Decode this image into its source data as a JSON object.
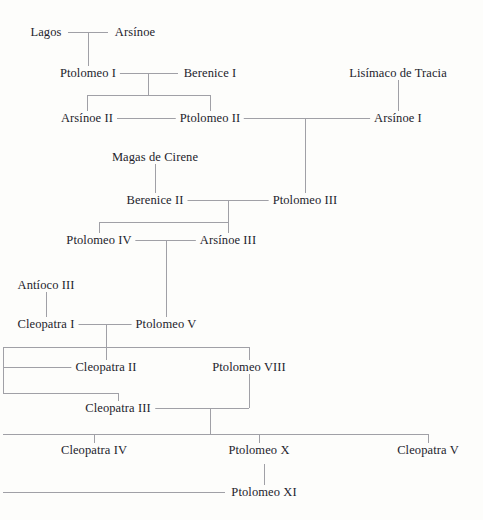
{
  "diagram": {
    "line_color": "#a0a0a6",
    "text_color": "#23232b",
    "background_color": "#fdfdfb"
  },
  "nodes": [
    {
      "id": "lagos",
      "label": "Lagos",
      "x": 46,
      "y": 32
    },
    {
      "id": "arsinoe",
      "label": "Arsínoe",
      "x": 135,
      "y": 32
    },
    {
      "id": "ptolomeo1",
      "label": "Ptolomeo I",
      "x": 88,
      "y": 73
    },
    {
      "id": "berenice1",
      "label": "Berenice I",
      "x": 210,
      "y": 73
    },
    {
      "id": "lisimaco",
      "label": "Lisímaco de Tracia",
      "x": 398,
      "y": 73
    },
    {
      "id": "arsinoe2",
      "label": "Arsínoe II",
      "x": 87,
      "y": 118
    },
    {
      "id": "ptolomeo2",
      "label": "Ptolomeo II",
      "x": 210,
      "y": 118
    },
    {
      "id": "arsinoe1",
      "label": "Arsínoe I",
      "x": 398,
      "y": 118
    },
    {
      "id": "magas",
      "label": "Magas de Cirene",
      "x": 155,
      "y": 157
    },
    {
      "id": "berenice2",
      "label": "Berenice II",
      "x": 155,
      "y": 200
    },
    {
      "id": "ptolomeo3",
      "label": "Ptolomeo III",
      "x": 305,
      "y": 200
    },
    {
      "id": "ptolomeo4",
      "label": "Ptolomeo IV",
      "x": 99,
      "y": 240
    },
    {
      "id": "arsinoe3",
      "label": "Arsínoe III",
      "x": 228,
      "y": 240
    },
    {
      "id": "antioco3",
      "label": "Antíoco III",
      "x": 46,
      "y": 285
    },
    {
      "id": "cleopatra1",
      "label": "Cleopatra I",
      "x": 46,
      "y": 324
    },
    {
      "id": "ptolomeo5",
      "label": "Ptolomeo V",
      "x": 166,
      "y": 324
    },
    {
      "id": "cleopatra2",
      "label": "Cleopatra II",
      "x": 106,
      "y": 367
    },
    {
      "id": "ptolomeo8",
      "label": "Ptolomeo VIII",
      "x": 249,
      "y": 367
    },
    {
      "id": "cleopatra3",
      "label": "Cleopatra III",
      "x": 118,
      "y": 408
    },
    {
      "id": "cleopatra4",
      "label": "Cleopatra IV",
      "x": 94,
      "y": 450
    },
    {
      "id": "ptolomeo10",
      "label": "Ptolomeo X",
      "x": 259,
      "y": 450
    },
    {
      "id": "cleopatra5",
      "label": "Cleopatra V",
      "x": 428,
      "y": 450
    },
    {
      "id": "ptolomeo11",
      "label": "Ptolomeo XI",
      "x": 264,
      "y": 492
    }
  ],
  "hlines": [
    {
      "id": "lagos-arsinoe-union",
      "x": 68,
      "y": 32,
      "w": 40
    },
    {
      "id": "ptolomeo1-berenice1-union",
      "x": 110,
      "y": 73,
      "w": 68
    },
    {
      "id": "ptolomeo1-children-bar",
      "x": 87,
      "y": 95,
      "w": 124
    },
    {
      "id": "arsinoe2-ptolomeo2-union",
      "x": 110,
      "y": 118,
      "w": 68
    },
    {
      "id": "ptolomeo2-arsinoe1-union",
      "x": 242,
      "y": 118,
      "w": 131
    },
    {
      "id": "berenice2-ptolomeo3-union",
      "x": 183,
      "y": 200,
      "w": 90
    },
    {
      "id": "berenice2-children-bar",
      "x": 99,
      "y": 222,
      "w": 129
    },
    {
      "id": "ptolomeo4-arsinoe3-union",
      "x": 130,
      "y": 240,
      "w": 68
    },
    {
      "id": "cleopatra1-ptolomeo5-union",
      "x": 74,
      "y": 324,
      "w": 62
    },
    {
      "id": "ptolomeo5-children-bar",
      "x": 3,
      "y": 347,
      "w": 246
    },
    {
      "id": "cleopatra2-left-bar",
      "x": 3,
      "y": 367,
      "w": 70
    },
    {
      "id": "cleopatra3-left-bar",
      "x": 3,
      "y": 393,
      "w": 115
    },
    {
      "id": "cleopatra3-ptolomeo8-bar",
      "x": 153,
      "y": 408,
      "w": 96
    },
    {
      "id": "cleopatra3-children-bar",
      "x": 3,
      "y": 434,
      "w": 425
    },
    {
      "id": "ptolomeo11-bar",
      "x": 3,
      "y": 492,
      "w": 222
    }
  ],
  "vlines": [
    {
      "id": "lagos-to-ptolomeo1",
      "x": 88,
      "y": 32,
      "h": 41
    },
    {
      "id": "ptolomeo1-stem",
      "x": 148,
      "y": 73,
      "h": 22
    },
    {
      "id": "arsinoe2-drop",
      "x": 87,
      "y": 95,
      "h": 23
    },
    {
      "id": "ptolomeo2-drop",
      "x": 210,
      "y": 95,
      "h": 23
    },
    {
      "id": "lisimaco-to-arsinoe1",
      "x": 398,
      "y": 73,
      "h": 45
    },
    {
      "id": "ptolomeo2-to-ptolomeo3",
      "x": 305,
      "y": 118,
      "h": 82
    },
    {
      "id": "magas-to-berenice2",
      "x": 155,
      "y": 157,
      "h": 43
    },
    {
      "id": "berenice2-stem",
      "x": 228,
      "y": 200,
      "h": 40
    },
    {
      "id": "ptolomeo4-drop",
      "x": 99,
      "y": 222,
      "h": 18
    },
    {
      "id": "ptolomeo4-arsinoe3-stem",
      "x": 166,
      "y": 240,
      "h": 84
    },
    {
      "id": "antioco3-to-cleopatra1",
      "x": 46,
      "y": 285,
      "h": 39
    },
    {
      "id": "cleopatra1-stem",
      "x": 106,
      "y": 324,
      "h": 43
    },
    {
      "id": "ptolomeo5-left-drop",
      "x": 3,
      "y": 347,
      "h": 46
    },
    {
      "id": "ptolomeo8-drop",
      "x": 249,
      "y": 347,
      "h": 61
    },
    {
      "id": "cleopatra3-drop",
      "x": 118,
      "y": 393,
      "h": 15
    },
    {
      "id": "cleopatra3-stem",
      "x": 210,
      "y": 408,
      "h": 26
    },
    {
      "id": "cleopatra4-drop",
      "x": 94,
      "y": 434,
      "h": 16
    },
    {
      "id": "ptolomeo10-drop",
      "x": 259,
      "y": 434,
      "h": 16
    },
    {
      "id": "cleopatra5-drop",
      "x": 428,
      "y": 434,
      "h": 16
    },
    {
      "id": "ptolomeo10-to-ptolomeo11",
      "x": 264,
      "y": 464,
      "h": 28
    }
  ]
}
